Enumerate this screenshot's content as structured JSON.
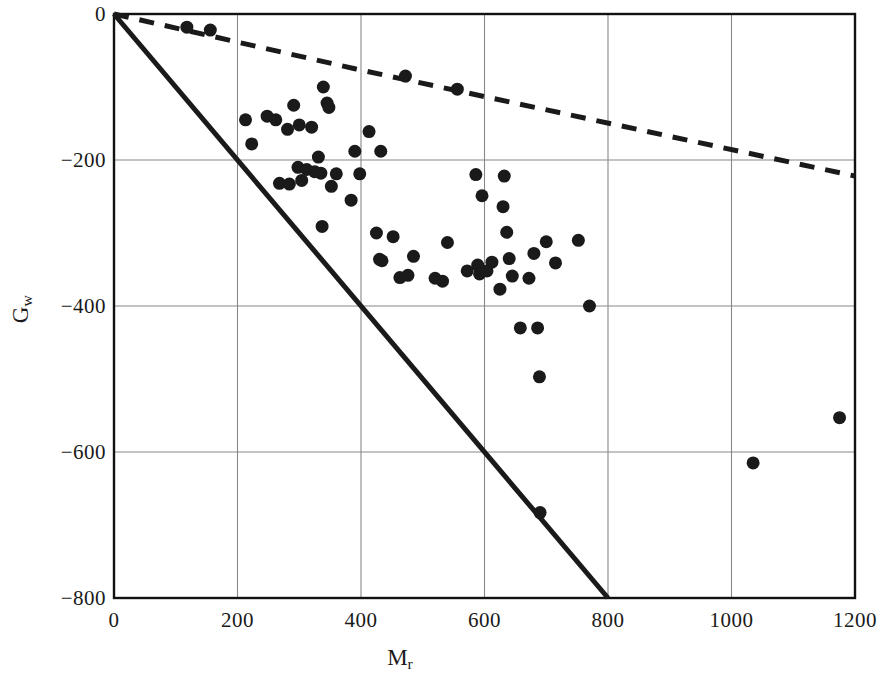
{
  "chart_data": {
    "type": "scatter",
    "title": "",
    "xlabel": "M_r",
    "ylabel": "G_w",
    "xlabel_base": "M",
    "xlabel_sub": "r",
    "ylabel_base": "G",
    "ylabel_sub": "w",
    "xlim": [
      0,
      1200
    ],
    "ylim": [
      -800,
      0
    ],
    "xticks": [
      0,
      200,
      400,
      600,
      800,
      1000,
      1200
    ],
    "yticks": [
      0,
      -200,
      -400,
      -600,
      -800
    ],
    "xtick_labels": [
      "0",
      "200",
      "400",
      "600",
      "800",
      "1000",
      "1200"
    ],
    "ytick_labels": [
      "0",
      "−200",
      "−400",
      "−600",
      "−800"
    ],
    "grid": true,
    "grid_color": "#888888",
    "legend": "none",
    "marker_color": "#1a1a1a",
    "marker_size": 13,
    "series": [
      {
        "name": "data",
        "style": "scatter",
        "points": [
          [
            118,
            -18
          ],
          [
            156,
            -22
          ],
          [
            213,
            -145
          ],
          [
            223,
            -178
          ],
          [
            248,
            -140
          ],
          [
            262,
            -145
          ],
          [
            268,
            -232
          ],
          [
            281,
            -158
          ],
          [
            284,
            -233
          ],
          [
            291,
            -125
          ],
          [
            298,
            -210
          ],
          [
            300,
            -152
          ],
          [
            304,
            -228
          ],
          [
            312,
            -213
          ],
          [
            320,
            -155
          ],
          [
            325,
            -216
          ],
          [
            331,
            -196
          ],
          [
            335,
            -218
          ],
          [
            337,
            -291
          ],
          [
            339,
            -100
          ],
          [
            345,
            -122
          ],
          [
            348,
            -128
          ],
          [
            352,
            -236
          ],
          [
            360,
            -219
          ],
          [
            384,
            -255
          ],
          [
            390,
            -188
          ],
          [
            398,
            -219
          ],
          [
            413,
            -161
          ],
          [
            425,
            -300
          ],
          [
            430,
            -336
          ],
          [
            432,
            -188
          ],
          [
            434,
            -338
          ],
          [
            452,
            -305
          ],
          [
            463,
            -361
          ],
          [
            472,
            -85
          ],
          [
            476,
            -358
          ],
          [
            485,
            -332
          ],
          [
            520,
            -362
          ],
          [
            532,
            -366
          ],
          [
            540,
            -313
          ],
          [
            556,
            -103
          ],
          [
            572,
            -352
          ],
          [
            586,
            -220
          ],
          [
            589,
            -344
          ],
          [
            592,
            -356
          ],
          [
            596,
            -249
          ],
          [
            604,
            -352
          ],
          [
            612,
            -340
          ],
          [
            625,
            -377
          ],
          [
            630,
            -264
          ],
          [
            632,
            -222
          ],
          [
            636,
            -299
          ],
          [
            640,
            -335
          ],
          [
            645,
            -359
          ],
          [
            658,
            -430
          ],
          [
            672,
            -362
          ],
          [
            680,
            -328
          ],
          [
            686,
            -430
          ],
          [
            689,
            -497
          ],
          [
            690,
            -683
          ],
          [
            700,
            -312
          ],
          [
            715,
            -341
          ],
          [
            752,
            -310
          ],
          [
            770,
            -400
          ],
          [
            1035,
            -615
          ],
          [
            1175,
            -553
          ]
        ]
      },
      {
        "name": "solid-bound",
        "style": "line-solid",
        "points": [
          [
            0,
            0
          ],
          [
            800,
            -800
          ]
        ],
        "color": "#1a1a1a",
        "width": 5
      },
      {
        "name": "dashed-bound",
        "style": "line-dashed",
        "points": [
          [
            0,
            0
          ],
          [
            390,
            -75
          ],
          [
            1200,
            -222
          ]
        ],
        "color": "#1a1a1a",
        "width": 5,
        "dash": "15 11"
      }
    ]
  },
  "axes": {
    "frame_color": "#111111",
    "background": "#ffffff"
  }
}
